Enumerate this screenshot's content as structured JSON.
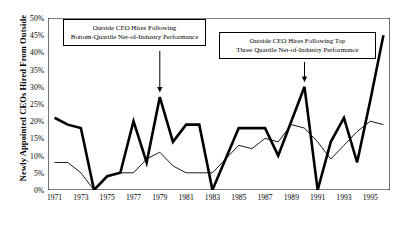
{
  "chart_data": {
    "type": "line",
    "title": "",
    "xlabel": "",
    "ylabel": "Newly Appointed CEOs Hired From Outside",
    "ylim": [
      0,
      50
    ],
    "xlim": [
      1970.5,
      1996.5
    ],
    "grid": false,
    "legend": "none",
    "y_unit": "%",
    "yticks": [
      "0%",
      "5%",
      "10%",
      "15%",
      "20%",
      "25%",
      "30%",
      "35%",
      "40%",
      "45%",
      "50%"
    ],
    "ytick_values": [
      0,
      5,
      10,
      15,
      20,
      25,
      30,
      35,
      40,
      45,
      50
    ],
    "xticks": [
      "1971",
      "1973",
      "1975",
      "1977",
      "1979",
      "1981",
      "1983",
      "1985",
      "1987",
      "1989",
      "1991",
      "1993",
      "1995"
    ],
    "xtick_values": [
      1971,
      1973,
      1975,
      1977,
      1979,
      1981,
      1983,
      1985,
      1987,
      1989,
      1991,
      1993,
      1995
    ],
    "x": [
      1971,
      1972,
      1973,
      1974,
      1975,
      1976,
      1977,
      1978,
      1979,
      1980,
      1981,
      1982,
      1983,
      1984,
      1985,
      1986,
      1987,
      1988,
      1989,
      1990,
      1991,
      1992,
      1993,
      1994,
      1995,
      1996
    ],
    "series": [
      {
        "name": "Outside CEO Hires Following Bottom-Quartile Net-of-Industry Performance",
        "style": "bold",
        "color": "#000000",
        "width": 2.6,
        "values": [
          21,
          19,
          18,
          0,
          4,
          5,
          20,
          8,
          27,
          14,
          19,
          19,
          0,
          9,
          18,
          18,
          18,
          10,
          20,
          30,
          0,
          14,
          21,
          8,
          26,
          45
        ]
      },
      {
        "name": "Outside CEO Hires Following Top Three Quartile Net-of-Industry Performance",
        "style": "thin",
        "color": "#000000",
        "width": 0.9,
        "values": [
          8,
          8,
          5,
          0,
          4,
          5,
          5,
          9,
          11,
          7,
          5,
          5,
          5,
          9,
          13,
          12,
          15,
          14,
          19,
          18,
          14,
          9,
          13,
          17,
          20,
          19
        ]
      }
    ],
    "annotations": [
      {
        "id": "ann1",
        "lines": [
          "Outside CEO Hires Following",
          "Bottom-Quartile Net-of-Industry Performance"
        ],
        "arrow_target_year": 1979,
        "arrow_target_value": 27
      },
      {
        "id": "ann2",
        "lines": [
          "Outside CEO Hires Following Top",
          "Three Quartile Net-of-Industry Performance"
        ],
        "arrow_target_year": 1990,
        "arrow_target_value": 30
      }
    ]
  }
}
